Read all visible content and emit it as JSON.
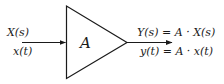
{
  "diagram": {
    "type": "block-diagram",
    "block": {
      "shape": "triangle",
      "label": "A",
      "meaning": "gain/amplifier"
    },
    "input": {
      "laplace": "X(s)",
      "time": "x(t)"
    },
    "output": {
      "laplace": "Y(s) = A · X(s)",
      "time": "y(t) = A · x(t)"
    },
    "colors": {
      "stroke": "#1a1a1a",
      "background": "#ffffff"
    }
  }
}
